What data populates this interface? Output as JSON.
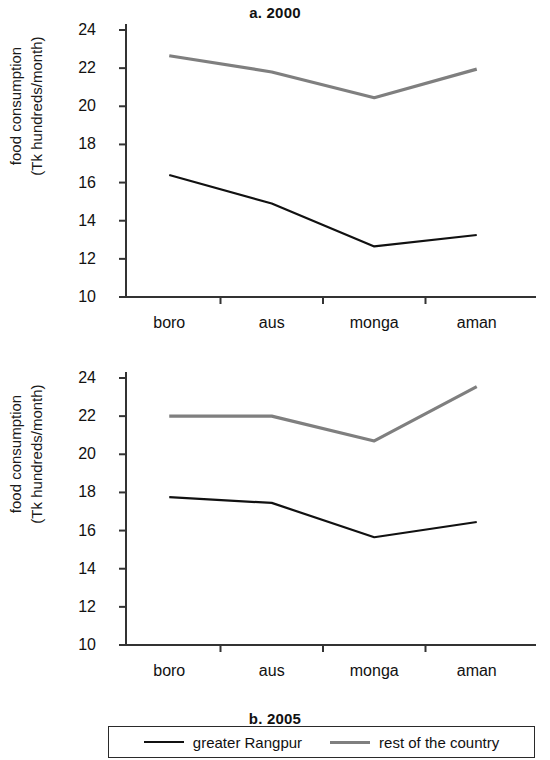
{
  "figure": {
    "ylabel_line1": "food consumption",
    "ylabel_line2": "(Tk hundreds/month)"
  },
  "legend": {
    "series_black_label": "greater Rangpur",
    "series_gray_label": "rest of the country",
    "black_color": "#111111",
    "gray_color": "#7f7f7f"
  },
  "panels": [
    {
      "title": "a. 2000"
    },
    {
      "title": "b. 2005"
    }
  ],
  "axis": {
    "y_ticks": [
      "10",
      "12",
      "14",
      "16",
      "18",
      "20",
      "22",
      "24"
    ],
    "x_ticks": [
      "boro",
      "aus",
      "monga",
      "aman"
    ]
  },
  "chart_data": [
    {
      "type": "line",
      "title": "a. 2000",
      "xlabel": "",
      "ylabel": "food consumption (Tk hundreds/month)",
      "categories": [
        "boro",
        "aus",
        "monga",
        "aman"
      ],
      "ylim": [
        10,
        24
      ],
      "yticks": [
        10,
        12,
        14,
        16,
        18,
        20,
        22,
        24
      ],
      "grid": false,
      "legend_position": "bottom-outside",
      "series": [
        {
          "name": "greater Rangpur",
          "color": "#111111",
          "values": [
            16.4,
            14.9,
            12.65,
            13.25
          ]
        },
        {
          "name": "rest of the country",
          "color": "#7f7f7f",
          "values": [
            22.65,
            21.8,
            20.45,
            21.95
          ]
        }
      ]
    },
    {
      "type": "line",
      "title": "b. 2005",
      "xlabel": "",
      "ylabel": "food consumption (Tk hundreds/month)",
      "categories": [
        "boro",
        "aus",
        "monga",
        "aman"
      ],
      "ylim": [
        10,
        24
      ],
      "yticks": [
        10,
        12,
        14,
        16,
        18,
        20,
        22,
        24
      ],
      "grid": false,
      "legend_position": "bottom-outside",
      "series": [
        {
          "name": "greater Rangpur",
          "color": "#111111",
          "values": [
            17.75,
            17.45,
            15.65,
            16.45
          ]
        },
        {
          "name": "rest of the country",
          "color": "#7f7f7f",
          "values": [
            22.0,
            22.0,
            20.7,
            23.55
          ]
        }
      ]
    }
  ]
}
